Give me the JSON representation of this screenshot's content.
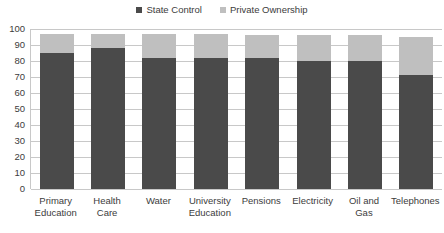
{
  "chart_data": {
    "type": "bar",
    "subtype": "stacked-column",
    "title": "",
    "subtitle": "",
    "xlabel": "",
    "ylabel": "",
    "ylim": [
      0,
      100
    ],
    "ytick_step": 10,
    "ytick_labels": [
      "100",
      "90",
      "80",
      "70",
      "60",
      "50",
      "40",
      "30",
      "20",
      "10",
      "0"
    ],
    "grid": true,
    "legend_position": "top-center",
    "categories": [
      "Primary Education",
      "Health Care",
      "Water",
      "University Education",
      "Pensions",
      "Electricity",
      "Oil and Gas",
      "Telephones"
    ],
    "series": [
      {
        "name": "State Control",
        "color": "#4a4a4a",
        "values": [
          85,
          88,
          82,
          82,
          82,
          80,
          80,
          71
        ]
      },
      {
        "name": "Private Ownership",
        "color": "#bfbfbf",
        "values": [
          12,
          9,
          15,
          15,
          14,
          16,
          16,
          24
        ]
      }
    ],
    "totals": [
      97,
      97,
      97,
      97,
      96,
      96,
      96,
      95
    ]
  },
  "legend": {
    "entries": [
      {
        "label": "State Control",
        "color": "#4a4a4a"
      },
      {
        "label": "Private Ownership",
        "color": "#bfbfbf"
      }
    ]
  },
  "colors": {
    "state_control": "#4a4a4a",
    "private_ownership": "#bfbfbf",
    "gridline": "#c8c8c8",
    "text": "#3c3c3c",
    "background": "#ffffff"
  }
}
